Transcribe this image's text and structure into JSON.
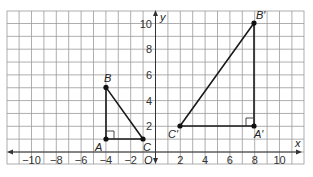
{
  "diagram": {
    "type": "coordinate-plane",
    "axes": {
      "x_label": "x",
      "y_label": "y",
      "origin_label": "O",
      "x_ticks": [
        {
          "value": -10,
          "label": "−10"
        },
        {
          "value": -8,
          "label": "−8"
        },
        {
          "value": -6,
          "label": "−6"
        },
        {
          "value": -4,
          "label": "−4"
        },
        {
          "value": -2,
          "label": "−2"
        },
        {
          "value": 2,
          "label": "2"
        },
        {
          "value": 4,
          "label": "4"
        },
        {
          "value": 6,
          "label": "6"
        },
        {
          "value": 8,
          "label": "8"
        },
        {
          "value": 10,
          "label": "10"
        }
      ],
      "y_ticks": [
        {
          "value": 2,
          "label": "2"
        },
        {
          "value": 4,
          "label": "4"
        },
        {
          "value": 6,
          "label": "6"
        },
        {
          "value": 8,
          "label": "8"
        },
        {
          "value": 10,
          "label": "10"
        }
      ],
      "x_range": [
        -12,
        12
      ],
      "y_range": [
        -1,
        11
      ]
    },
    "triangles": [
      {
        "name": "ABC",
        "vertices": [
          {
            "label": "A",
            "x": -4,
            "y": 1
          },
          {
            "label": "B",
            "x": -4,
            "y": 5
          },
          {
            "label": "C",
            "x": -1,
            "y": 1
          }
        ],
        "right_angle_at": "A"
      },
      {
        "name": "A'B'C'",
        "vertices": [
          {
            "label": "A′",
            "x": 8,
            "y": 2
          },
          {
            "label": "B′",
            "x": 8,
            "y": 10
          },
          {
            "label": "C′",
            "x": 2,
            "y": 2
          }
        ],
        "right_angle_at": "A'"
      }
    ]
  }
}
